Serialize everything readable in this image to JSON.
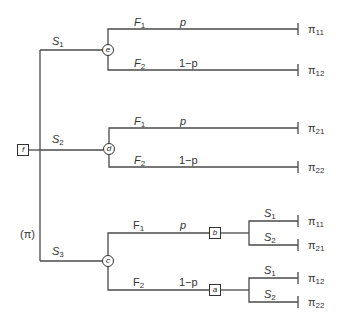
{
  "diagram": {
    "type": "decision-tree",
    "root": {
      "label": "f",
      "shape": "square"
    },
    "root_annotation": "(π)",
    "strategies": [
      {
        "label": "S",
        "sub": "1",
        "node": "e",
        "branches": [
          {
            "label": "F",
            "sub": "1",
            "prob": "p",
            "payoff": "π",
            "payoff_sub": "11"
          },
          {
            "label": "F",
            "sub": "2",
            "prob": "1−p",
            "payoff": "π",
            "payoff_sub": "12"
          }
        ]
      },
      {
        "label": "S",
        "sub": "2",
        "node": "d",
        "branches": [
          {
            "label": "F",
            "sub": "1",
            "prob": "p",
            "payoff": "π",
            "payoff_sub": "21"
          },
          {
            "label": "F",
            "sub": "2",
            "prob": "1−p",
            "payoff": "π",
            "payoff_sub": "22"
          }
        ]
      },
      {
        "label": "S",
        "sub": "3",
        "node": "c",
        "branches": [
          {
            "label": "F",
            "sub": "1",
            "prob": "p",
            "decision_node": "b",
            "sub_branches": [
              {
                "label": "S",
                "sub": "1",
                "payoff": "π",
                "payoff_sub": "11"
              },
              {
                "label": "S",
                "sub": "2",
                "payoff": "π",
                "payoff_sub": "21"
              }
            ]
          },
          {
            "label": "F",
            "sub": "2",
            "prob": "1−p",
            "decision_node": "a",
            "sub_branches": [
              {
                "label": "S",
                "sub": "1",
                "payoff": "π",
                "payoff_sub": "12"
              },
              {
                "label": "S",
                "sub": "2",
                "payoff": "π",
                "payoff_sub": "22"
              }
            ]
          }
        ]
      }
    ]
  }
}
